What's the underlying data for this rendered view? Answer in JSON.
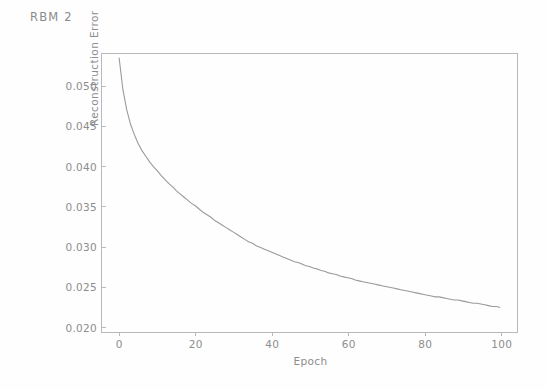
{
  "figure": {
    "title": "RBM  2",
    "background_color": "#fefefe",
    "axis_color": "#b9b9b9",
    "text_color": "#8d8d8d"
  },
  "chart_data": {
    "type": "line",
    "title": "RBM  2",
    "xlabel": "Epoch",
    "ylabel": "Reconstruction Error",
    "xlim": [
      -4.5,
      104.5
    ],
    "ylim": [
      0.0192,
      0.054
    ],
    "xticks": [
      0,
      20,
      40,
      60,
      80,
      100
    ],
    "xticklabels": [
      "0",
      "20",
      "40",
      "60",
      "80",
      "100"
    ],
    "yticks": [
      0.02,
      0.025,
      0.03,
      0.035,
      0.04,
      0.045,
      0.05
    ],
    "yticklabels": [
      "0.020",
      "0.025",
      "0.030",
      "0.035",
      "0.040",
      "0.045",
      "0.050"
    ],
    "grid": false,
    "legend": null,
    "line_color": "#9a9a9a",
    "line_width": 1.1,
    "series": [
      {
        "name": "Reconstruction Error",
        "x": [
          0,
          1,
          2,
          3,
          4,
          5,
          6,
          7,
          8,
          9,
          10,
          11,
          12,
          13,
          14,
          15,
          16,
          17,
          18,
          19,
          20,
          21,
          22,
          23,
          24,
          25,
          26,
          27,
          28,
          29,
          30,
          31,
          32,
          33,
          34,
          35,
          36,
          37,
          38,
          39,
          40,
          41,
          42,
          43,
          44,
          45,
          46,
          47,
          48,
          49,
          50,
          51,
          52,
          53,
          54,
          55,
          56,
          57,
          58,
          59,
          60,
          61,
          62,
          63,
          64,
          65,
          66,
          67,
          68,
          69,
          70,
          71,
          72,
          73,
          74,
          75,
          76,
          77,
          78,
          79,
          80,
          81,
          82,
          83,
          84,
          85,
          86,
          87,
          88,
          89,
          90,
          91,
          92,
          93,
          94,
          95,
          96,
          97,
          98,
          99,
          100
        ],
        "y": [
          0.0535,
          0.0495,
          0.047,
          0.0452,
          0.0439,
          0.0428,
          0.0419,
          0.0412,
          0.0405,
          0.0399,
          0.0394,
          0.0388,
          0.0383,
          0.0378,
          0.0374,
          0.0369,
          0.0365,
          0.0361,
          0.0357,
          0.0353,
          0.035,
          0.0346,
          0.0342,
          0.0339,
          0.0336,
          0.0332,
          0.0329,
          0.0326,
          0.0323,
          0.032,
          0.0317,
          0.0314,
          0.0311,
          0.0308,
          0.0305,
          0.0303,
          0.03,
          0.0298,
          0.0296,
          0.0294,
          0.0292,
          0.029,
          0.0288,
          0.0286,
          0.0284,
          0.0282,
          0.028,
          0.0279,
          0.0277,
          0.0275,
          0.0274,
          0.0272,
          0.0271,
          0.0269,
          0.0268,
          0.0266,
          0.0265,
          0.0264,
          0.0262,
          0.0261,
          0.026,
          0.0259,
          0.0257,
          0.0256,
          0.0255,
          0.0254,
          0.0253,
          0.0252,
          0.0251,
          0.025,
          0.0249,
          0.0248,
          0.0247,
          0.0246,
          0.0245,
          0.0244,
          0.0243,
          0.0242,
          0.0241,
          0.024,
          0.0239,
          0.0238,
          0.0237,
          0.0236,
          0.0236,
          0.0235,
          0.0234,
          0.0233,
          0.0232,
          0.0232,
          0.0231,
          0.023,
          0.0229,
          0.0228,
          0.0228,
          0.0227,
          0.0226,
          0.0225,
          0.0224,
          0.0224,
          0.0223
        ]
      }
    ]
  }
}
